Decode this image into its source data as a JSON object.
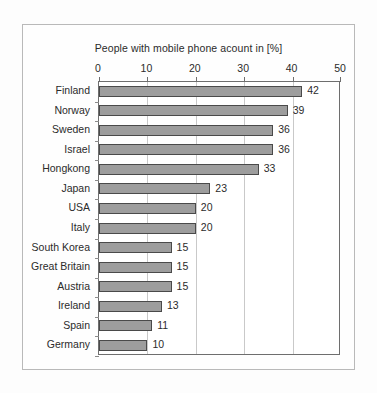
{
  "chart_data": {
    "type": "bar",
    "orientation": "horizontal",
    "title": "People with mobile phone acount in [%]",
    "xlabel": "",
    "ylabel": "",
    "xlim": [
      0,
      50
    ],
    "xticks": [
      0,
      10,
      20,
      30,
      40,
      50
    ],
    "grid": "vertical",
    "legend": null,
    "categories": [
      "Finland",
      "Norway",
      "Sweden",
      "Israel",
      "Hongkong",
      "Japan",
      "USA",
      "Italy",
      "South Korea",
      "Great Britain",
      "Austria",
      "Ireland",
      "Spain",
      "Germany"
    ],
    "values": [
      42,
      39,
      36,
      36,
      33,
      23,
      20,
      20,
      15,
      15,
      15,
      13,
      11,
      10
    ],
    "value_labels": [
      "42",
      "39",
      "36",
      "36",
      "33",
      "23",
      "20",
      "20",
      "15",
      "15",
      "15",
      "13",
      "11",
      "10"
    ],
    "tick_labels": [
      "0",
      "10",
      "20",
      "30",
      "40",
      "50"
    ],
    "colors": {
      "bar_fill": "#9d9d9d",
      "bar_stroke": "#4a4a4a",
      "grid": "#c9c9c9",
      "axis": "#6e6e6e",
      "text": "#2b2b2b",
      "background": "#fdfdfd"
    }
  }
}
